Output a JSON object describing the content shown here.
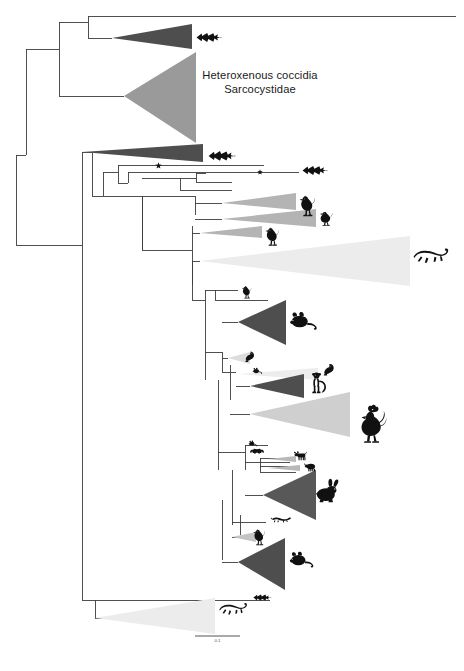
{
  "figure": {
    "type": "phylogenetic-tree",
    "width": 464,
    "height": 671,
    "background": "#ffffff"
  },
  "labels": {
    "sarcocystidae": "Heteroxenous coccidia\nSarcocystidae"
  },
  "scalebar": {
    "value": "0.1",
    "x": 195,
    "y": 636,
    "length": 45
  },
  "colors": {
    "branch": "#3d3d3d",
    "triangle_dark": "#4e4e4e",
    "triangle_mid": "#9a9a9a",
    "triangle_light": "#c9c9c9",
    "triangle_pale": "#e6e6e6",
    "silhouette": "#111111",
    "text": "#1a1a1a"
  },
  "tree": {
    "branches": [
      {
        "name": "root-stem",
        "x1": 16,
        "y1": 155,
        "x2": 16,
        "y2": 245
      },
      {
        "name": "root-hbar-top",
        "x1": 16,
        "y1": 155,
        "x2": 26,
        "y2": 155
      },
      {
        "name": "root-node-v",
        "x1": 26,
        "y1": 49,
        "x2": 26,
        "y2": 155
      },
      {
        "name": "root-top-h",
        "x1": 26,
        "y1": 49,
        "x2": 59,
        "y2": 49
      },
      {
        "name": "clade1-v",
        "x1": 59,
        "y1": 22,
        "x2": 59,
        "y2": 96
      },
      {
        "name": "clade1-top-h",
        "x1": 59,
        "y1": 22,
        "x2": 88,
        "y2": 22
      },
      {
        "name": "longbranch-fish",
        "x1": 88,
        "y1": 16,
        "x2": 456,
        "y2": 16
      },
      {
        "name": "longbranch-v",
        "x1": 88,
        "y1": 16,
        "x2": 88,
        "y2": 38
      },
      {
        "name": "dark-tri1-stem",
        "x1": 88,
        "y1": 38,
        "x2": 112,
        "y2": 38
      },
      {
        "name": "clade1-bot-h",
        "x1": 59,
        "y1": 96,
        "x2": 117,
        "y2": 96
      },
      {
        "name": "sarco-stem",
        "x1": 117,
        "y1": 96,
        "x2": 124,
        "y2": 96
      },
      {
        "name": "main-v",
        "x1": 26,
        "y1": 155,
        "x2": 26,
        "y2": 155
      },
      {
        "name": "lower-stem-h",
        "x1": 16,
        "y1": 245,
        "x2": 82,
        "y2": 245
      },
      {
        "name": "lower-v",
        "x1": 82,
        "y1": 152,
        "x2": 82,
        "y2": 245
      },
      {
        "name": "dark-tri2-h",
        "x1": 82,
        "y1": 152,
        "x2": 92,
        "y2": 152
      },
      {
        "name": "node-a-v",
        "x1": 92,
        "y1": 152,
        "x2": 92,
        "y2": 196
      },
      {
        "name": "node-a-h",
        "x1": 92,
        "y1": 196,
        "x2": 103,
        "y2": 196
      },
      {
        "name": "node-b-v",
        "x1": 103,
        "y1": 172,
        "x2": 103,
        "y2": 196
      },
      {
        "name": "node-b-h1",
        "x1": 103,
        "y1": 172,
        "x2": 118,
        "y2": 172
      },
      {
        "name": "node-c-v",
        "x1": 118,
        "y1": 165,
        "x2": 118,
        "y2": 183
      },
      {
        "name": "branch-star1",
        "x1": 118,
        "y1": 165,
        "x2": 264,
        "y2": 165
      },
      {
        "name": "branch-star2-h",
        "x1": 118,
        "y1": 183,
        "x2": 128,
        "y2": 183
      },
      {
        "name": "node-d-v",
        "x1": 128,
        "y1": 172,
        "x2": 128,
        "y2": 183
      },
      {
        "name": "branch-fish2",
        "x1": 128,
        "y1": 172,
        "x2": 299,
        "y2": 172
      },
      {
        "name": "node-e-h",
        "x1": 103,
        "y1": 196,
        "x2": 142,
        "y2": 196
      },
      {
        "name": "node-e-v",
        "x1": 142,
        "y1": 196,
        "x2": 142,
        "y2": 250
      },
      {
        "name": "node-f-h",
        "x1": 142,
        "y1": 178,
        "x2": 180,
        "y2": 178
      },
      {
        "name": "node-f-v",
        "x1": 180,
        "y1": 178,
        "x2": 180,
        "y2": 190
      },
      {
        "name": "small-g-h",
        "x1": 180,
        "y1": 178,
        "x2": 196,
        "y2": 178
      },
      {
        "name": "small-g-v",
        "x1": 196,
        "y1": 173,
        "x2": 196,
        "y2": 182
      },
      {
        "name": "small-g-b1",
        "x1": 196,
        "y1": 173,
        "x2": 206,
        "y2": 173
      },
      {
        "name": "small-g-b2",
        "x1": 196,
        "y1": 182,
        "x2": 232,
        "y2": 182
      },
      {
        "name": "small-g-b3",
        "x1": 180,
        "y1": 190,
        "x2": 232,
        "y2": 190
      },
      {
        "name": "node-h-v",
        "x1": 142,
        "y1": 196,
        "x2": 142,
        "y2": 250
      },
      {
        "name": "node-i-h",
        "x1": 142,
        "y1": 196,
        "x2": 195,
        "y2": 196
      },
      {
        "name": "node-i-v",
        "x1": 195,
        "y1": 196,
        "x2": 195,
        "y2": 215
      },
      {
        "name": "bird-tri1-stem",
        "x1": 195,
        "y1": 203,
        "x2": 222,
        "y2": 203
      },
      {
        "name": "bird-tri2-stem",
        "x1": 195,
        "y1": 219,
        "x2": 222,
        "y2": 219
      },
      {
        "name": "node-j-h",
        "x1": 142,
        "y1": 250,
        "x2": 192,
        "y2": 250
      },
      {
        "name": "node-k-v",
        "x1": 192,
        "y1": 226,
        "x2": 192,
        "y2": 285
      },
      {
        "name": "bird-tri3-stem",
        "x1": 192,
        "y1": 233,
        "x2": 200,
        "y2": 233
      },
      {
        "name": "pale-tri-stem",
        "x1": 192,
        "y1": 261,
        "x2": 200,
        "y2": 261
      },
      {
        "name": "node-l-v",
        "x1": 192,
        "y1": 262,
        "x2": 192,
        "y2": 300
      },
      {
        "name": "node-m-h",
        "x1": 192,
        "y1": 300,
        "x2": 205,
        "y2": 300
      },
      {
        "name": "node-m-v",
        "x1": 205,
        "y1": 290,
        "x2": 205,
        "y2": 330
      },
      {
        "name": "small-bird-h",
        "x1": 205,
        "y1": 290,
        "x2": 238,
        "y2": 290
      },
      {
        "name": "small-bird-v",
        "x1": 215,
        "y1": 290,
        "x2": 215,
        "y2": 300
      },
      {
        "name": "small-bird-b",
        "x1": 215,
        "y1": 300,
        "x2": 268,
        "y2": 300
      },
      {
        "name": "mouse-tri-stem",
        "x1": 222,
        "y1": 322,
        "x2": 238,
        "y2": 322
      },
      {
        "name": "node-n-v",
        "x1": 205,
        "y1": 330,
        "x2": 205,
        "y2": 380
      },
      {
        "name": "node-o-h",
        "x1": 205,
        "y1": 352,
        "x2": 222,
        "y2": 352
      },
      {
        "name": "squirrel-pale-stem",
        "x1": 222,
        "y1": 358,
        "x2": 228,
        "y2": 358
      },
      {
        "name": "node-p-v",
        "x1": 222,
        "y1": 352,
        "x2": 222,
        "y2": 372
      },
      {
        "name": "node-q-h",
        "x1": 222,
        "y1": 372,
        "x2": 236,
        "y2": 372
      },
      {
        "name": "monkey-tri-stem",
        "x1": 236,
        "y1": 386,
        "x2": 250,
        "y2": 386
      },
      {
        "name": "node-r-v",
        "x1": 230,
        "y1": 365,
        "x2": 230,
        "y2": 400
      },
      {
        "name": "rooster-stem",
        "x1": 230,
        "y1": 414,
        "x2": 250,
        "y2": 414
      },
      {
        "name": "node-s-v",
        "x1": 218,
        "y1": 380,
        "x2": 218,
        "y2": 470
      },
      {
        "name": "node-t-h",
        "x1": 218,
        "y1": 452,
        "x2": 245,
        "y2": 452
      },
      {
        "name": "bat-h",
        "x1": 245,
        "y1": 445,
        "x2": 268,
        "y2": 445
      },
      {
        "name": "node-u-v",
        "x1": 245,
        "y1": 445,
        "x2": 245,
        "y2": 470
      },
      {
        "name": "cow-cluster-h",
        "x1": 245,
        "y1": 462,
        "x2": 290,
        "y2": 462
      },
      {
        "name": "cow-cluster-v",
        "x1": 260,
        "y1": 458,
        "x2": 260,
        "y2": 472
      },
      {
        "name": "cow-b1",
        "x1": 260,
        "y1": 458,
        "x2": 296,
        "y2": 458
      },
      {
        "name": "cow-b2",
        "x1": 260,
        "y1": 466,
        "x2": 300,
        "y2": 466
      },
      {
        "name": "cow-b3",
        "x1": 260,
        "y1": 472,
        "x2": 296,
        "y2": 472
      },
      {
        "name": "rabbit-tri-stem",
        "x1": 245,
        "y1": 495,
        "x2": 263,
        "y2": 495
      },
      {
        "name": "node-v2-v",
        "x1": 232,
        "y1": 470,
        "x2": 232,
        "y2": 525
      },
      {
        "name": "weasel-h",
        "x1": 232,
        "y1": 522,
        "x2": 266,
        "y2": 522
      },
      {
        "name": "node-w-v",
        "x1": 240,
        "y1": 515,
        "x2": 240,
        "y2": 535
      },
      {
        "name": "light-small-tri-stem",
        "x1": 232,
        "y1": 537,
        "x2": 240,
        "y2": 537
      },
      {
        "name": "node-x-v",
        "x1": 222,
        "y1": 500,
        "x2": 222,
        "y2": 560
      },
      {
        "name": "mouse2-tri-stem",
        "x1": 222,
        "y1": 562,
        "x2": 238,
        "y2": 562
      },
      {
        "name": "bottom-stem-v",
        "x1": 82,
        "y1": 245,
        "x2": 82,
        "y2": 600
      },
      {
        "name": "bottom-node-h",
        "x1": 82,
        "y1": 600,
        "x2": 95,
        "y2": 600
      },
      {
        "name": "bottom-node-v",
        "x1": 95,
        "y1": 600,
        "x2": 95,
        "y2": 618
      },
      {
        "name": "bottom-fish-h",
        "x1": 95,
        "y1": 600,
        "x2": 270,
        "y2": 600
      },
      {
        "name": "bottom-liz-stem",
        "x1": 95,
        "y1": 618,
        "x2": 140,
        "y2": 618
      }
    ],
    "triangles": [
      {
        "name": "dark-fish-clade-1",
        "apex_x": 112,
        "apex_y": 38,
        "right_x": 192,
        "top_y": 24,
        "bottom_y": 49,
        "fill": "#4e4e4e"
      },
      {
        "name": "sarcocystidae-clade",
        "apex_x": 124,
        "apex_y": 96,
        "right_x": 196,
        "top_y": 52,
        "bottom_y": 143,
        "fill": "#9a9a9a"
      },
      {
        "name": "dark-fish-clade-2",
        "apex_x": 82,
        "apex_y": 152,
        "right_x": 203,
        "top_y": 144,
        "bottom_y": 162,
        "fill": "#4e4e4e"
      },
      {
        "name": "bird-clade-1",
        "apex_x": 222,
        "apex_y": 203,
        "right_x": 296,
        "top_y": 193,
        "bottom_y": 210,
        "fill": "#b4b4b4"
      },
      {
        "name": "bird-clade-2",
        "apex_x": 222,
        "apex_y": 219,
        "right_x": 316,
        "top_y": 209,
        "bottom_y": 227,
        "fill": "#b4b4b4"
      },
      {
        "name": "bird-clade-3",
        "apex_x": 200,
        "apex_y": 233,
        "right_x": 262,
        "top_y": 226,
        "bottom_y": 238,
        "fill": "#b4b4b4"
      },
      {
        "name": "lizard-large-clade",
        "apex_x": 200,
        "apex_y": 261,
        "right_x": 410,
        "top_y": 236,
        "bottom_y": 286,
        "fill": "#ececec"
      },
      {
        "name": "mouse-clade-1",
        "apex_x": 238,
        "apex_y": 322,
        "right_x": 286,
        "top_y": 300,
        "bottom_y": 345,
        "fill": "#4e4e4e"
      },
      {
        "name": "squirrel-pale-clade",
        "apex_x": 228,
        "apex_y": 358,
        "right_x": 250,
        "top_y": 352,
        "bottom_y": 364,
        "fill": "#dcdcdc"
      },
      {
        "name": "squirrel-clade",
        "apex_x": 238,
        "apex_y": 374,
        "right_x": 318,
        "top_y": 368,
        "bottom_y": 380,
        "fill": "#ececec"
      },
      {
        "name": "monkey-clade",
        "apex_x": 250,
        "apex_y": 386,
        "right_x": 304,
        "top_y": 374,
        "bottom_y": 398,
        "fill": "#4e4e4e"
      },
      {
        "name": "rooster-clade",
        "apex_x": 250,
        "apex_y": 414,
        "right_x": 350,
        "top_y": 392,
        "bottom_y": 437,
        "fill": "#cfcfcf"
      },
      {
        "name": "cow-small-clade-1",
        "apex_x": 268,
        "apex_y": 459,
        "right_x": 296,
        "top_y": 456,
        "bottom_y": 462,
        "fill": "#b8b8b8"
      },
      {
        "name": "cow-small-clade-2",
        "apex_x": 268,
        "apex_y": 468,
        "right_x": 300,
        "top_y": 465,
        "bottom_y": 471,
        "fill": "#b8b8b8"
      },
      {
        "name": "rabbit-clade",
        "apex_x": 263,
        "apex_y": 495,
        "right_x": 316,
        "top_y": 470,
        "bottom_y": 520,
        "fill": "#585858"
      },
      {
        "name": "small-light-clade",
        "apex_x": 232,
        "apex_y": 537,
        "right_x": 256,
        "top_y": 532,
        "bottom_y": 542,
        "fill": "#c4c4c4"
      },
      {
        "name": "mouse-clade-2",
        "apex_x": 238,
        "apex_y": 562,
        "right_x": 285,
        "top_y": 538,
        "bottom_y": 590,
        "fill": "#4e4e4e"
      },
      {
        "name": "bottom-lizard-clade",
        "apex_x": 95,
        "apex_y": 618,
        "right_x": 215,
        "top_y": 598,
        "bottom_y": 634,
        "fill": "#ececec"
      }
    ],
    "silhouettes": [
      {
        "name": "fish-icon",
        "kind": "fish",
        "x": 196,
        "y": 31,
        "size": 28
      },
      {
        "name": "fish-icon",
        "kind": "fish",
        "x": 208,
        "y": 149,
        "size": 30
      },
      {
        "name": "fish-icon",
        "kind": "fish",
        "x": 302,
        "y": 164,
        "size": 28
      },
      {
        "name": "bird-icon",
        "kind": "bird",
        "x": 298,
        "y": 194,
        "size": 18
      },
      {
        "name": "duck-icon",
        "kind": "duck",
        "x": 318,
        "y": 209,
        "size": 17
      },
      {
        "name": "bird-icon",
        "kind": "bird",
        "x": 264,
        "y": 226,
        "size": 16
      },
      {
        "name": "lizard-icon",
        "kind": "lizard",
        "x": 412,
        "y": 246,
        "size": 40
      },
      {
        "name": "bird-small-icon",
        "kind": "bird",
        "x": 241,
        "y": 285,
        "size": 11
      },
      {
        "name": "mouse-icon",
        "kind": "mouse",
        "x": 288,
        "y": 310,
        "size": 34
      },
      {
        "name": "squirrel-icon",
        "kind": "squirrel",
        "x": 242,
        "y": 350,
        "size": 14
      },
      {
        "name": "mouse-small-icon",
        "kind": "mouse",
        "x": 252,
        "y": 367,
        "size": 12
      },
      {
        "name": "squirrel-icon",
        "kind": "squirrel",
        "x": 320,
        "y": 362,
        "size": 16
      },
      {
        "name": "monkey-icon",
        "kind": "monkey",
        "x": 306,
        "y": 371,
        "size": 25
      },
      {
        "name": "rooster-icon",
        "kind": "rooster",
        "x": 355,
        "y": 404,
        "size": 32
      },
      {
        "name": "mouse-small-icon",
        "kind": "mouse",
        "x": 248,
        "y": 440,
        "size": 11
      },
      {
        "name": "bat-icon",
        "kind": "bat",
        "x": 249,
        "y": 448,
        "size": 16
      },
      {
        "name": "cow-icon",
        "kind": "cow",
        "x": 292,
        "y": 450,
        "size": 17
      },
      {
        "name": "sheep-icon",
        "kind": "sheep",
        "x": 303,
        "y": 462,
        "size": 14
      },
      {
        "name": "rabbit-icon",
        "kind": "rabbit",
        "x": 315,
        "y": 478,
        "size": 32
      },
      {
        "name": "weasel-icon",
        "kind": "weasel",
        "x": 270,
        "y": 515,
        "size": 22
      },
      {
        "name": "bird-small-icon",
        "kind": "bird",
        "x": 252,
        "y": 528,
        "size": 14
      },
      {
        "name": "mouse-icon",
        "kind": "mouse",
        "x": 288,
        "y": 550,
        "size": 30
      },
      {
        "name": "fish-icon",
        "kind": "fish",
        "x": 253,
        "y": 593,
        "size": 20
      },
      {
        "name": "lizard-icon",
        "kind": "lizard",
        "x": 218,
        "y": 601,
        "size": 32
      }
    ],
    "star_markers": [
      {
        "name": "support-star",
        "x": 155,
        "y": 162,
        "size": 7
      },
      {
        "name": "support-star",
        "x": 257,
        "y": 169,
        "size": 6
      }
    ]
  }
}
